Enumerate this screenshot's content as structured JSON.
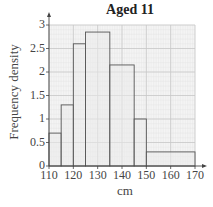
{
  "chart_data": {
    "type": "bar",
    "subtype": "histogram",
    "title": "Aged 11",
    "xlabel": "cm",
    "ylabel": "Frequency density",
    "xlim": [
      110,
      170
    ],
    "ylim": [
      0,
      3
    ],
    "x_ticks": [
      "110",
      "120",
      "130",
      "140",
      "150",
      "160",
      "170"
    ],
    "y_ticks": [
      "0",
      "0.5",
      "1",
      "1.5",
      "2",
      "2.5",
      "3"
    ],
    "grid": true,
    "bins": [
      {
        "from": 110,
        "to": 115,
        "value": 0.7
      },
      {
        "from": 115,
        "to": 120,
        "value": 1.3
      },
      {
        "from": 120,
        "to": 125,
        "value": 2.6
      },
      {
        "from": 125,
        "to": 135,
        "value": 2.85
      },
      {
        "from": 135,
        "to": 145,
        "value": 2.15
      },
      {
        "from": 145,
        "to": 150,
        "value": 1.0
      },
      {
        "from": 150,
        "to": 170,
        "value": 0.3
      }
    ],
    "colors": {
      "bar_fill": "#ebebeb",
      "bar_stroke": "#555555",
      "grid_major": "#c8c8c8",
      "grid_minor": "#e2e2e2",
      "axis": "#444444"
    }
  }
}
